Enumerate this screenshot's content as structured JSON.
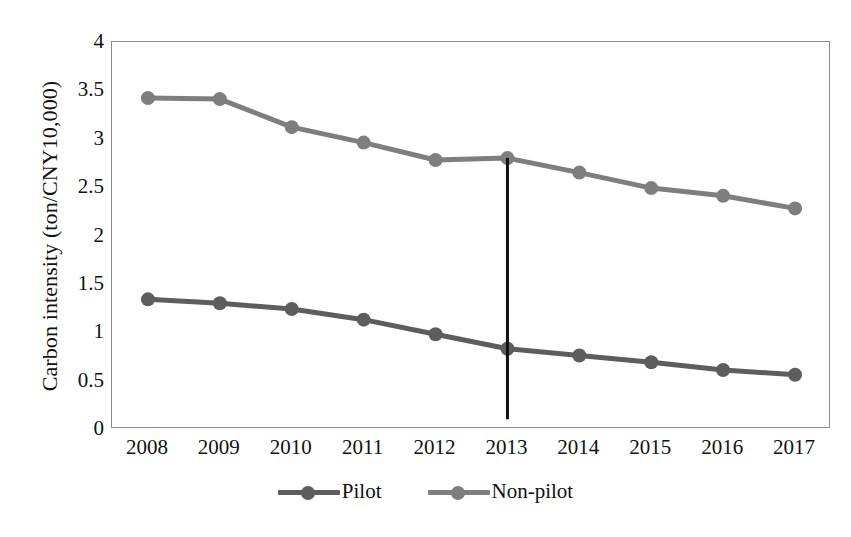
{
  "chart_data": {
    "type": "line",
    "title": "",
    "xlabel": "",
    "ylabel": "Carbon intensity (ton/CNY10,000)",
    "categories": [
      "2008",
      "2009",
      "2010",
      "2011",
      "2012",
      "2013",
      "2014",
      "2015",
      "2016",
      "2017"
    ],
    "x": [
      2008,
      2009,
      2010,
      2011,
      2012,
      2013,
      2014,
      2015,
      2016,
      2017
    ],
    "series": [
      {
        "name": "Pilot",
        "color": "#5d5d5d",
        "values": [
          1.34,
          1.3,
          1.24,
          1.13,
          0.98,
          0.83,
          0.76,
          0.69,
          0.61,
          0.56
        ]
      },
      {
        "name": "Non-pilot",
        "color": "#7e7e7e",
        "values": [
          3.42,
          3.41,
          3.12,
          2.96,
          2.78,
          2.8,
          2.65,
          2.49,
          2.41,
          2.28
        ]
      }
    ],
    "ylim": [
      0,
      4
    ],
    "yticks": [
      "0",
      "0.5",
      "1",
      "1.5",
      "2",
      "2.5",
      "3",
      "3.5",
      "4"
    ],
    "ytick_values": [
      0,
      0.5,
      1,
      1.5,
      2,
      2.5,
      3,
      3.5,
      4
    ],
    "grid": false,
    "legend_position": "bottom",
    "annotations": [
      {
        "kind": "vertical-reference-line",
        "x": "2013",
        "y_top": 2.8,
        "y_bottom": 0.1,
        "color": "#111111"
      }
    ]
  },
  "axes": {
    "y_title": "Carbon intensity (ton/CNY10,000)",
    "y_ticks": [
      "4",
      "3.5",
      "3",
      "2.5",
      "2",
      "1.5",
      "1",
      "0.5",
      "0"
    ],
    "x_ticks": [
      "2008",
      "2009",
      "2010",
      "2011",
      "2012",
      "2013",
      "2014",
      "2015",
      "2016",
      "2017"
    ]
  },
  "legend": {
    "entries": [
      {
        "label": "Pilot",
        "color": "#5d5d5d"
      },
      {
        "label": "Non-pilot",
        "color": "#7e7e7e"
      }
    ]
  }
}
